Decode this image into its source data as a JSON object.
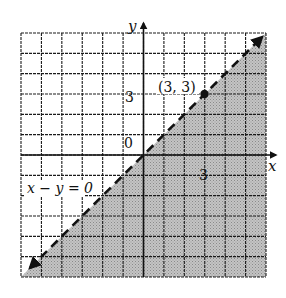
{
  "chart_data": {
    "type": "line",
    "title": "",
    "xlabel": "x",
    "ylabel": "y",
    "xlim": [
      -6,
      6
    ],
    "ylim": [
      -6,
      6
    ],
    "grid": true,
    "grid_step": 1,
    "x_tick_labels": [
      {
        "value": 3,
        "label": "3"
      }
    ],
    "y_tick_labels": [
      {
        "value": 3,
        "label": "3"
      }
    ],
    "origin_label": "0",
    "series": [
      {
        "name": "x - y = 0",
        "style": "dashed",
        "equation": "y = x",
        "x": [
          -6,
          6
        ],
        "y": [
          -6,
          6
        ],
        "arrows": "both"
      }
    ],
    "shaded_region": {
      "description": "half-plane below the boundary line",
      "inequality": "x - y > 0",
      "color": "#b8b8b8"
    },
    "points": [
      {
        "x": 3,
        "y": 3,
        "label": "(3, 3)"
      }
    ],
    "annotations": [
      {
        "text": "x - y = 0",
        "x": -4.2,
        "y": -1
      }
    ]
  },
  "labels": {
    "x_axis": "x",
    "y_axis": "y",
    "origin": "0",
    "x_tick": "3",
    "y_tick": "3",
    "point": "(3, 3)",
    "equation": "x − y = 0"
  },
  "colors": {
    "shade": "#b9b9b9",
    "grid": "#1a1a1a",
    "line": "#111111"
  }
}
